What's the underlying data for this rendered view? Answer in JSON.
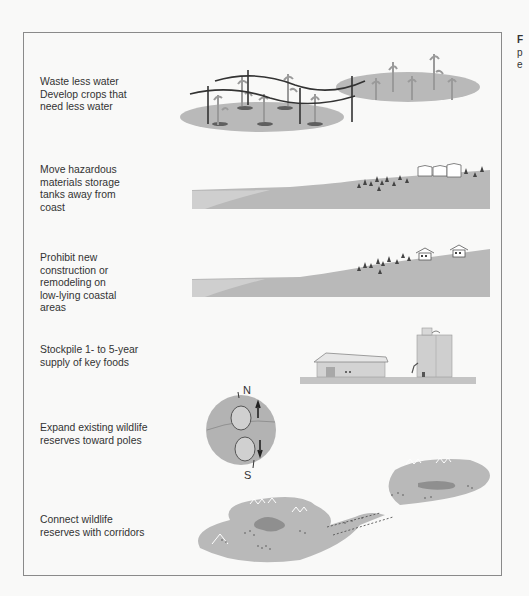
{
  "figure": {
    "side_caption": {
      "line1": "F",
      "line2": "p",
      "line3": "e"
    },
    "items": [
      {
        "label": "Waste less water\nDevelop crops that\nneed less water",
        "illustration": "crop-fields-icon"
      },
      {
        "label": "Move hazardous\nmaterials storage\ntanks away from\ncoast",
        "illustration": "coastline-storage-tanks-icon"
      },
      {
        "label": "Prohibit new\nconstruction or\nremodeling on\nlow-lying coastal\nareas",
        "illustration": "coastline-houses-icon"
      },
      {
        "label": "Stockpile 1- to 5-year\nsupply of key foods",
        "illustration": "barn-silo-icon"
      },
      {
        "label": "Expand existing wildlife\nreserves toward poles",
        "illustration": "globe-icon",
        "globe_labels": {
          "north": "N",
          "south": "S"
        }
      },
      {
        "label": "Connect wildlife\nreserves with corridors",
        "illustration": "wildlife-corridor-icon"
      }
    ],
    "colors": {
      "background": "#f9f9f8",
      "frame": "#8a8a8a",
      "land": "#b9b9b9",
      "dark": "#555555",
      "text": "#333333"
    }
  }
}
